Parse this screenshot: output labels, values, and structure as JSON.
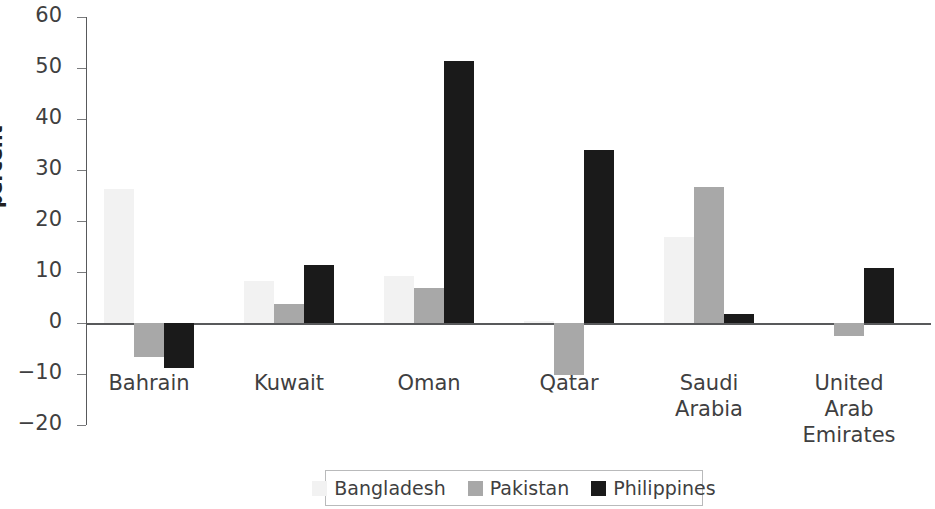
{
  "chart_data": {
    "type": "bar",
    "title": "",
    "subtitle": "",
    "xlabel": "",
    "ylabel": "percent",
    "ylim": [
      -20,
      60
    ],
    "yticks": [
      60,
      50,
      40,
      30,
      20,
      10,
      0,
      -10,
      -20
    ],
    "ytick_labels": [
      "60",
      "50",
      "40",
      "30",
      "20",
      "10",
      "0",
      "−10",
      "−20"
    ],
    "grid": false,
    "legend_position": "bottom",
    "categories": [
      "Bahrain",
      "Kuwait",
      "Oman",
      "Qatar",
      "Saudi\nArabia",
      "United\nArab\nEmirates"
    ],
    "series": [
      {
        "name": "Bangladesh",
        "color": "#f2f2f2",
        "values": [
          26.2,
          8.2,
          9.3,
          0.4,
          16.8,
          0.0
        ]
      },
      {
        "name": "Pakistan",
        "color": "#a8a8a8",
        "values": [
          -6.7,
          3.7,
          6.9,
          -10.2,
          26.6,
          -2.5
        ]
      },
      {
        "name": "Philippines",
        "color": "#1a1a1a",
        "values": [
          -8.8,
          11.4,
          51.4,
          34.0,
          1.8,
          10.8
        ]
      }
    ]
  },
  "legend": {
    "items": [
      {
        "label": "Bangladesh"
      },
      {
        "label": "Pakistan"
      },
      {
        "label": "Philippines"
      }
    ]
  }
}
